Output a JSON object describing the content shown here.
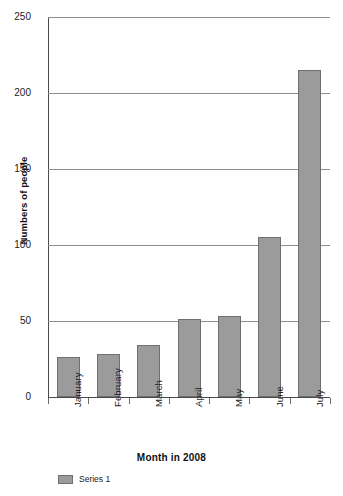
{
  "chart_data": {
    "type": "bar",
    "title": "",
    "subtitle": "",
    "categories": [
      "January",
      "February",
      "March",
      "April",
      "May",
      "June",
      "July"
    ],
    "values": [
      26,
      28,
      34,
      51,
      53,
      105,
      215
    ],
    "series": [
      {
        "name": "Series 1",
        "values": [
          26,
          28,
          34,
          51,
          53,
          105,
          215
        ]
      }
    ],
    "xlabel": "Month in 2008",
    "ylabel": "Numbers of people",
    "ylim": [
      0,
      250
    ],
    "yticks": [
      0,
      50,
      100,
      150,
      200,
      250
    ],
    "ytick_labels": [
      "0",
      "50",
      "100",
      "150",
      "200",
      "250"
    ],
    "grid": true,
    "grid_axis": "y",
    "legend": {
      "position": "bottom-left",
      "entries": [
        {
          "label": "Series 1",
          "color": "#9b9b9b"
        }
      ]
    },
    "colors": {
      "bar_fill": "#9b9b9b",
      "bar_border": "#6f6f6f",
      "gridline": "#8e8e8e",
      "axis": "#4a4a4a",
      "text": "#1b1b1b",
      "background": "#ffffff"
    }
  }
}
